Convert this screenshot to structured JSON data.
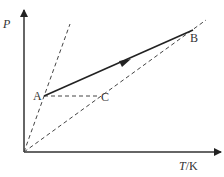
{
  "diagram": {
    "type": "P-T process diagram",
    "axes": {
      "y_label": "P",
      "x_label_var": "T",
      "x_label_unit": "/K"
    },
    "points": [
      {
        "id": "A",
        "label": "A",
        "x": 44,
        "y": 96
      },
      {
        "id": "B",
        "label": "B",
        "x": 193,
        "y": 30
      },
      {
        "id": "C",
        "label": "C",
        "x": 99,
        "y": 96
      }
    ],
    "lines": [
      {
        "from": "origin",
        "through": "A",
        "style": "dashed"
      },
      {
        "from": "origin",
        "through": "C",
        "to": "B",
        "style": "dashed"
      },
      {
        "from": "A",
        "to": "C",
        "style": "dashed"
      },
      {
        "from": "A",
        "to": "B",
        "style": "solid",
        "arrow": "A->B"
      }
    ],
    "colors": {
      "line": "#222222",
      "dashed": "#444444",
      "text": "#333333"
    }
  }
}
